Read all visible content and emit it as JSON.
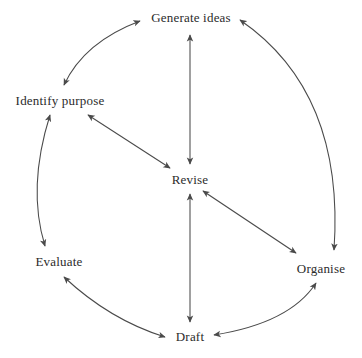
{
  "diagram": {
    "type": "cycle-diagram",
    "background_color": "#ffffff",
    "stroke_color": "#4a4a4a",
    "text_color": "#2b2b2b",
    "nodes": [
      {
        "id": "generate-ideas",
        "label": "Generate ideas",
        "x": 191,
        "y": 17
      },
      {
        "id": "identify-purpose",
        "label": "Identify purpose",
        "x": 60,
        "y": 100
      },
      {
        "id": "revise",
        "label": "Revise",
        "x": 190,
        "y": 179
      },
      {
        "id": "evaluate",
        "label": "Evaluate",
        "x": 59,
        "y": 261
      },
      {
        "id": "organise",
        "label": "Organise",
        "x": 321,
        "y": 268
      },
      {
        "id": "draft",
        "label": "Draft",
        "x": 190,
        "y": 336
      }
    ],
    "connectors": [
      {
        "id": "identify-purpose-to-generate-ideas",
        "from": "identify-purpose",
        "to": "generate-ideas",
        "style": "curved",
        "heads": "both"
      },
      {
        "id": "generate-ideas-to-organise",
        "from": "generate-ideas",
        "to": "organise",
        "style": "curved",
        "heads": "both"
      },
      {
        "id": "identify-purpose-to-evaluate",
        "from": "identify-purpose",
        "to": "evaluate",
        "style": "curved",
        "heads": "both"
      },
      {
        "id": "evaluate-to-draft",
        "from": "evaluate",
        "to": "draft",
        "style": "curved",
        "heads": "both"
      },
      {
        "id": "draft-to-organise",
        "from": "draft",
        "to": "organise",
        "style": "curved",
        "heads": "both"
      },
      {
        "id": "generate-ideas-to-revise",
        "from": "generate-ideas",
        "to": "revise",
        "style": "straight",
        "heads": "both"
      },
      {
        "id": "revise-to-draft",
        "from": "revise",
        "to": "draft",
        "style": "straight",
        "heads": "both"
      },
      {
        "id": "identify-purpose-to-revise",
        "from": "identify-purpose",
        "to": "revise",
        "style": "straight",
        "heads": "both"
      },
      {
        "id": "revise-to-organise",
        "from": "revise",
        "to": "organise",
        "style": "straight",
        "heads": "both"
      }
    ]
  }
}
